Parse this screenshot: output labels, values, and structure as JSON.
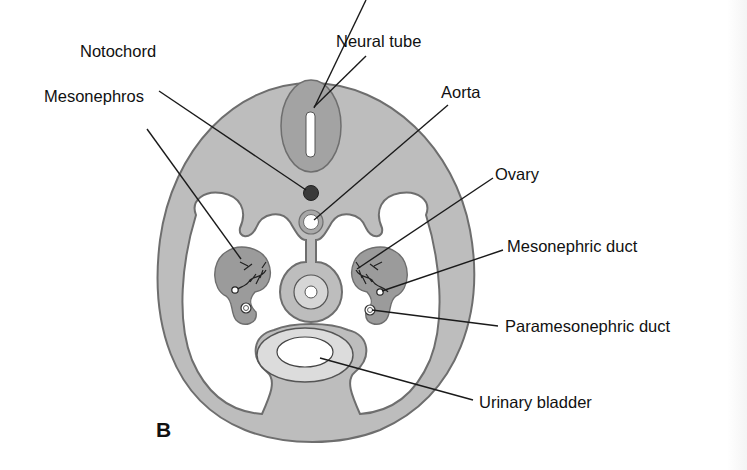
{
  "figure": {
    "panel_letter": "B",
    "colors": {
      "body_fill": "#bdbdbd",
      "body_outline": "#6e6e6e",
      "neural_tube_fill": "#a3a3a3",
      "notochord_fill": "#3a3a3a",
      "mesonephros_fill": "#9b9b9b",
      "bladder_wall_fill": "#dcdcdc",
      "lumen_fill": "#ffffff",
      "line_color": "#1a1a1a"
    }
  },
  "labels": {
    "neural_tube": "Neural tube",
    "notochord": "Notochord",
    "aorta": "Aorta",
    "mesonephros": "Mesonephros",
    "ovary": "Ovary",
    "mesonephric_duct": "Mesonephric duct",
    "paramesonephric_duct": "Paramesonephric duct",
    "urinary_bladder": "Urinary bladder"
  }
}
